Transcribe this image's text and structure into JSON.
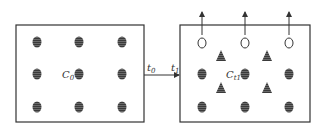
{
  "diagram": {
    "left_box": {
      "label": "C",
      "label_sub": "0",
      "particles": "filled-striped-ellipse",
      "grid": "3x3"
    },
    "right_box": {
      "label": "C",
      "label_sub": "t1",
      "particles": [
        "filled-striped-ellipse",
        "open-circle",
        "striped-triangle"
      ]
    },
    "arrow": {
      "start_label": "t",
      "start_sub": "0",
      "end_label": "t",
      "end_sub": "1"
    },
    "colors": {
      "stroke": "#333333",
      "fill": "#444444",
      "background": "#ffffff"
    }
  }
}
